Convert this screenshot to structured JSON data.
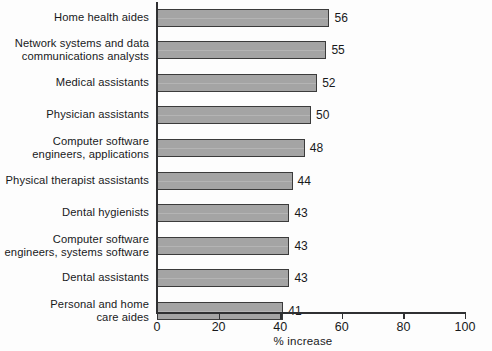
{
  "chart_data": {
    "type": "bar",
    "orientation": "horizontal",
    "title": "",
    "xlabel": "% increase",
    "ylabel": "",
    "xlim": [
      0,
      100
    ],
    "xticks": [
      0,
      20,
      40,
      60,
      80,
      100
    ],
    "grid": false,
    "legend": null,
    "bar_color": "#a4a4a4",
    "bar_edge_color": "#3b3b3b",
    "axis_color": "#2f3032",
    "categories": [
      "Home health aides",
      "Network systems and data\ncommunications analysts",
      "Medical assistants",
      "Physician assistants",
      "Computer software\nengineers, applications",
      "Physical therapist assistants",
      "Dental hygienists",
      "Computer software\nengineers, systems software",
      "Dental assistants",
      "Personal and home\ncare aides"
    ],
    "values": [
      56,
      55,
      52,
      50,
      48,
      44,
      43,
      43,
      43,
      41
    ],
    "value_labels": [
      "56",
      "55",
      "52",
      "50",
      "48",
      "44",
      "43",
      "43",
      "43",
      "41"
    ]
  }
}
